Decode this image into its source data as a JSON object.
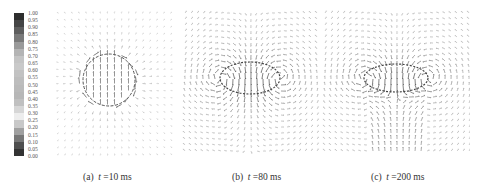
{
  "figure": {
    "colorbar": {
      "ticks": [
        "1.00",
        "0.95",
        "0.90",
        "0.85",
        "0.80",
        "0.75",
        "0.70",
        "0.65",
        "0.60",
        "0.55",
        "0.50",
        "0.45",
        "0.40",
        "0.35",
        "0.30",
        "0.25",
        "0.20",
        "0.15",
        "0.10",
        "0.05",
        "0.00"
      ],
      "colors_top_to_bottom": [
        "#2e2e2e",
        "#454545",
        "#5e5e5e",
        "#7a7a7a",
        "#9a9a9a",
        "#b4b4b4",
        "#c4c4c4",
        "#c9c9c9",
        "#c2c2c2",
        "#bdbdbd",
        "#bababa",
        "#b7b7b7",
        "#c0c0c0",
        "#d6d6d6",
        "#ededed",
        "#c8c8c8",
        "#a0a0a0",
        "#777777",
        "#4f4f4f",
        "#333333"
      ]
    },
    "panels": [
      {
        "id": "a",
        "label": "(a)",
        "t_symbol": "t",
        "t_value": "=10 ms",
        "caption_x": 83,
        "x": 55,
        "w": 120,
        "h": 150,
        "center": [
          54,
          72
        ],
        "shape": "circle",
        "rx": 26,
        "ry": 26,
        "spacing": 7,
        "field_strength": 0.35
      },
      {
        "id": "b",
        "label": "(b)",
        "t_symbol": "t",
        "t_value": "=80 ms",
        "caption_x": 232,
        "x": 182,
        "w": 140,
        "h": 150,
        "center": [
          68,
          70
        ],
        "shape": "vortex",
        "rx": 30,
        "ry": 16,
        "spacing": 6,
        "field_strength": 1.0
      },
      {
        "id": "c",
        "label": "(c)",
        "t_symbol": "t",
        "t_value": "=200 ms",
        "caption_x": 371,
        "x": 322,
        "w": 148,
        "h": 150,
        "center": [
          74,
          70
        ],
        "shape": "vortex-jet",
        "rx": 32,
        "ry": 14,
        "spacing": 6,
        "field_strength": 1.0
      }
    ]
  }
}
